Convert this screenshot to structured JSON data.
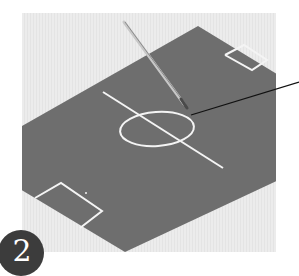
{
  "figure": {
    "step_badge": {
      "number": "2"
    },
    "colors": {
      "background_box": "#ebebeb",
      "pitch": "#6e6e6e",
      "lines": "#f4f4f4",
      "pen": "#b5b5b5",
      "leader_line": "#111111",
      "badge": "#3c3c3c"
    },
    "elements": [
      "pitch",
      "halfway-line",
      "center-circle",
      "penalty-box-top-right",
      "penalty-box-bottom-left",
      "penalty-spot",
      "pen",
      "leader-line"
    ]
  }
}
